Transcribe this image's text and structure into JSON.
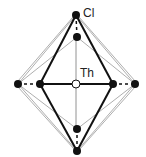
{
  "diagram": {
    "labels": {
      "cl": "Cl",
      "th": "Th"
    },
    "center": {
      "name": "Th",
      "x": 76,
      "y": 84
    },
    "atoms": [
      {
        "name": "Cl-top-outer",
        "x": 76,
        "y": 15
      },
      {
        "name": "Cl-top-inner",
        "x": 77,
        "y": 37
      },
      {
        "name": "Cl-left-outer",
        "x": 18,
        "y": 84
      },
      {
        "name": "Cl-left-inner",
        "x": 40,
        "y": 84
      },
      {
        "name": "Cl-right-inner",
        "x": 113,
        "y": 84
      },
      {
        "name": "Cl-right-outer",
        "x": 135,
        "y": 84
      },
      {
        "name": "Cl-bottom-inner",
        "x": 77,
        "y": 129
      },
      {
        "name": "Cl-bottom-outer",
        "x": 77,
        "y": 151
      }
    ],
    "colors": {
      "atom": "#111111",
      "bond": "#111111",
      "thin_line": "#888888",
      "center_fill": "#ffffff"
    }
  }
}
